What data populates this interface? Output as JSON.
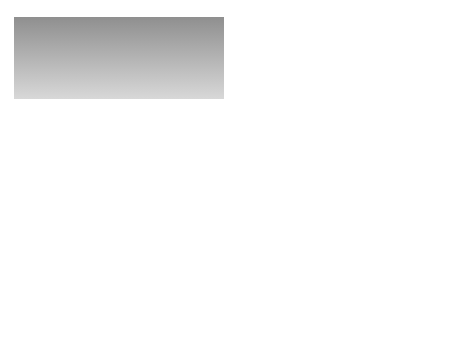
{
  "diagram": {
    "type": "iceberg",
    "labels": {
      "conscious": "Conscious",
      "subconscious": "Subconscious/Preconscious",
      "unconscious": "Unconscious",
      "nonconscious_left": "Nonconscious",
      "nonconscious_right": "Nonconscious"
    },
    "colors": {
      "sky_top": "#8e8e8e",
      "sky_bottom": "#d6d6d6",
      "water_top": "#8a8a8a",
      "water_bottom": "#616161",
      "ice_light": "#f7f7f7",
      "ice_shadow": "#c9c9c9",
      "ice_underwater": "#9a9a9a"
    }
  }
}
